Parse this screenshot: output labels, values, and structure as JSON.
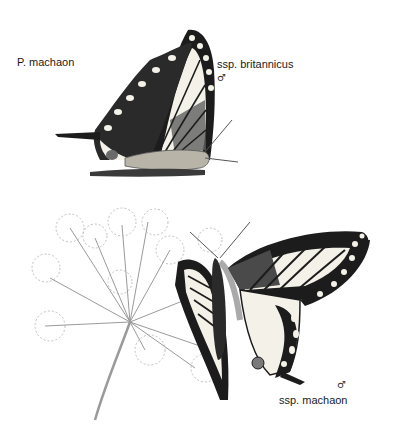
{
  "plate": {
    "species_label": "P. machaon",
    "upper_figure": {
      "subspecies_label": "ssp. britannicus",
      "sex_symbol": "♂",
      "view": "underside, wings closed"
    },
    "lower_figure": {
      "subspecies_label": "ssp. machaon",
      "sex_symbol": "♂",
      "view": "upperside, perched on umbellifer flower"
    },
    "colors": {
      "background": "#ffffff",
      "wing_dark": "#1c1c1c",
      "wing_pale": "#f4f2e8",
      "wing_grey": "#5a5a5a",
      "plant_stroke": "#9a9a9a",
      "text": "#1a1a1a"
    }
  }
}
